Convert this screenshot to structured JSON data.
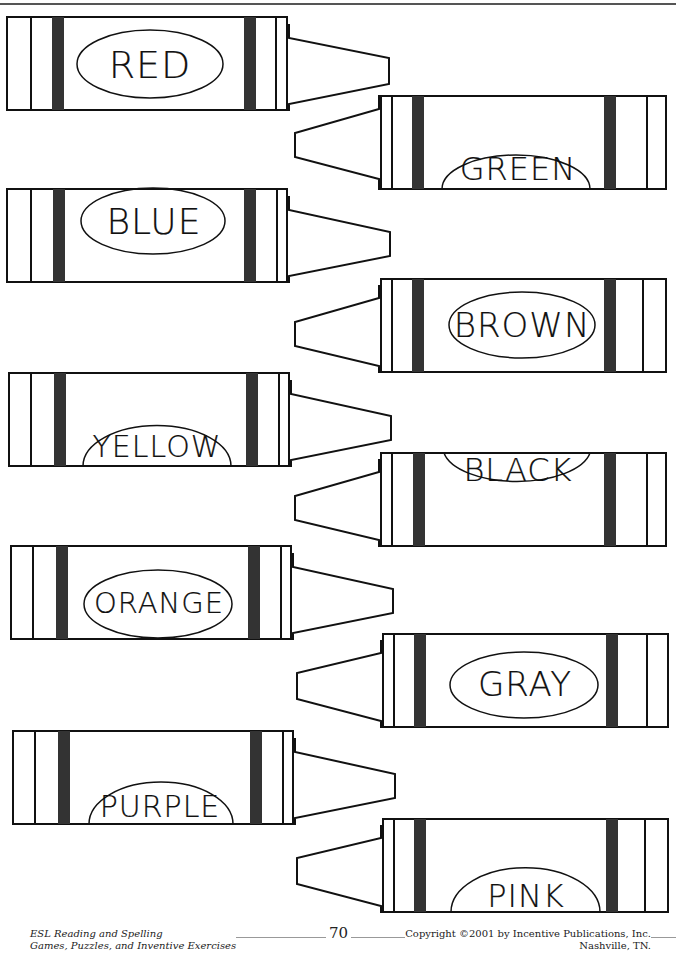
{
  "page": {
    "background": "#ffffff",
    "ink_color": "#111111"
  },
  "crayons": [
    {
      "label": "RED",
      "side": "left",
      "label_pos": "center"
    },
    {
      "label": "GREEN",
      "side": "right",
      "label_pos": "bottom"
    },
    {
      "label": "BLUE",
      "side": "left",
      "label_pos": "center"
    },
    {
      "label": "BROWN",
      "side": "right",
      "label_pos": "center"
    },
    {
      "label": "YELLOW",
      "side": "left",
      "label_pos": "bottom"
    },
    {
      "label": "BLACK",
      "side": "right",
      "label_pos": "top"
    },
    {
      "label": "ORANGE",
      "side": "left",
      "label_pos": "center"
    },
    {
      "label": "GRAY",
      "side": "right",
      "label_pos": "center"
    },
    {
      "label": "PURPLE",
      "side": "left",
      "label_pos": "bottom"
    },
    {
      "label": "PINK",
      "side": "right",
      "label_pos": "bottom"
    }
  ],
  "footer": {
    "book_title": "ESL Reading and Spelling",
    "book_subtitle": "Games, Puzzles, and Inventive Exercises",
    "page_number": "70",
    "copyright": "Copyright ©2001 by Incentive Publications, Inc.",
    "location": "Nashville, TN."
  }
}
